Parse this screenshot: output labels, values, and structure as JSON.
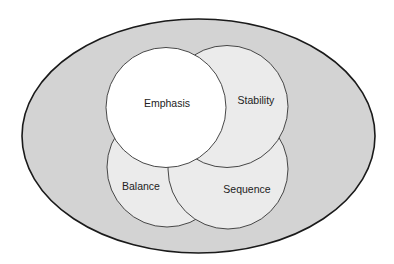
{
  "diagram": {
    "type": "venn-in-ellipse",
    "colors": {
      "outer_fill": "#d3d3d3",
      "outer_stroke": "#1a1a1a",
      "circle_fill": "#ebebeb",
      "emphasis_fill": "#ffffff",
      "circle_stroke": "#333333",
      "text": "#222222"
    },
    "outer_ellipse": {
      "cx": 198.5,
      "cy": 136,
      "rx": 176.5,
      "ry": 117
    },
    "circles": [
      {
        "id": "balance",
        "label": "Balance",
        "cx": 167,
        "cy": 167,
        "r": 60,
        "label_x": 141,
        "label_y": 190
      },
      {
        "id": "sequence",
        "label": "Sequence",
        "cx": 228,
        "cy": 169,
        "r": 60,
        "label_x": 247,
        "label_y": 193
      },
      {
        "id": "stability",
        "label": "Stability",
        "cx": 227,
        "cy": 106.5,
        "r": 61,
        "label_x": 256,
        "label_y": 104
      },
      {
        "id": "emphasis",
        "label": "Emphasis",
        "cx": 166,
        "cy": 107.5,
        "r": 60,
        "label_x": 167,
        "label_y": 107
      }
    ]
  }
}
